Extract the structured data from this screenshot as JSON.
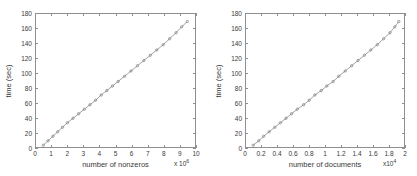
{
  "figure": {
    "background": "#ffffff",
    "axis_color": "#8f8f8f",
    "line_color": "#7a7a7a",
    "marker_color": "#6e6e6e"
  },
  "chart_data": [
    {
      "type": "line",
      "id": "time-vs-nonzeros",
      "title": "",
      "xlabel": "number of nonzeros",
      "ylabel": "time (sec)",
      "x_exponent_label": "x 10",
      "x_exponent_power": "6",
      "y_exponent_label": "",
      "xlim": [
        0,
        10
      ],
      "ylim": [
        0,
        180
      ],
      "grid": false,
      "legend": "none",
      "xticks": [
        0,
        1,
        2,
        3,
        4,
        5,
        6,
        7,
        8,
        9,
        10
      ],
      "xticklabels": [
        "0",
        "1",
        "2",
        "3",
        "4",
        "5",
        "6",
        "7",
        "8",
        "9",
        "10"
      ],
      "yticks": [
        0,
        20,
        40,
        60,
        80,
        100,
        120,
        140,
        160,
        180
      ],
      "yticklabels": [
        "0",
        "20",
        "40",
        "60",
        "80",
        "100",
        "120",
        "140",
        "160",
        "180"
      ],
      "marker": "circle",
      "x": [
        0.45,
        0.75,
        1.05,
        1.35,
        1.65,
        1.95,
        2.3,
        2.65,
        3.0,
        3.35,
        3.7,
        4.05,
        4.4,
        4.75,
        5.1,
        5.5,
        5.9,
        6.3,
        6.7,
        7.1,
        7.5,
        7.9,
        8.3,
        8.7,
        9.05,
        9.4
      ],
      "y": [
        5,
        11,
        17,
        23,
        29,
        35,
        41,
        47,
        53,
        59,
        65,
        72,
        78,
        84,
        90,
        97,
        104,
        111,
        118,
        125,
        132,
        139,
        147,
        155,
        163,
        170
      ]
    },
    {
      "type": "line",
      "id": "time-vs-documents",
      "title": "",
      "xlabel": "number of documents",
      "ylabel": "time (sec)",
      "x_exponent_label": "x10",
      "x_exponent_power": "4",
      "y_exponent_label": "",
      "xlim": [
        0,
        2
      ],
      "ylim": [
        0,
        180
      ],
      "grid": false,
      "legend": "none",
      "xticks": [
        0,
        0.2,
        0.4,
        0.6,
        0.8,
        1.0,
        1.2,
        1.4,
        1.6,
        1.8,
        2.0
      ],
      "xticklabels": [
        "0",
        "0.2",
        "0.4",
        "0.6",
        "0.8",
        "1",
        "1.2",
        "1.4",
        "1.6",
        "1.8",
        "2"
      ],
      "yticks": [
        0,
        20,
        40,
        60,
        80,
        100,
        120,
        140,
        160,
        180
      ],
      "yticklabels": [
        "0",
        "20",
        "40",
        "60",
        "80",
        "100",
        "120",
        "140",
        "160",
        "180"
      ],
      "marker": "circle",
      "x": [
        0.09,
        0.16,
        0.22,
        0.29,
        0.36,
        0.43,
        0.5,
        0.57,
        0.64,
        0.72,
        0.79,
        0.86,
        0.94,
        1.01,
        1.09,
        1.16,
        1.24,
        1.32,
        1.4,
        1.48,
        1.56,
        1.64,
        1.72,
        1.8,
        1.86,
        1.91
      ],
      "y": [
        5,
        11,
        17,
        23,
        29,
        35,
        41,
        47,
        53,
        59,
        65,
        72,
        78,
        84,
        90,
        97,
        104,
        111,
        118,
        125,
        132,
        139,
        147,
        155,
        163,
        170
      ]
    }
  ]
}
